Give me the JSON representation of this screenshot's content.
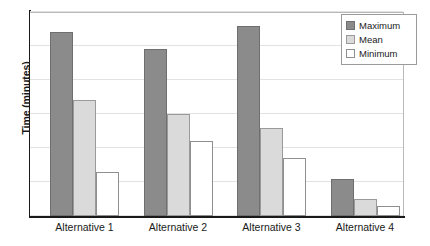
{
  "chart_data": {
    "type": "bar",
    "title": "",
    "xlabel": "",
    "ylabel": "Time (minutes)",
    "categories": [
      "Alternative 1",
      "Alternative 2",
      "Alternative 3",
      "Alternative 4"
    ],
    "series": [
      {
        "name": "Maximum",
        "color": "#8b8b8b",
        "values": [
          5.4,
          4.9,
          5.6,
          1.1
        ]
      },
      {
        "name": "Mean",
        "color": "#dadada",
        "values": [
          3.4,
          3.0,
          2.6,
          0.5
        ]
      },
      {
        "name": "Minimum",
        "color": "#ffffff",
        "values": [
          1.3,
          2.2,
          1.7,
          0.3
        ]
      }
    ],
    "ylim": [
      0,
      6
    ],
    "gridlines": [
      0,
      1,
      2,
      3,
      4,
      5,
      6
    ],
    "grid": true,
    "y_tick_labels_visible": false,
    "legend": {
      "position": "top-right",
      "entries": [
        "Maximum",
        "Mean",
        "Minimum"
      ]
    }
  }
}
